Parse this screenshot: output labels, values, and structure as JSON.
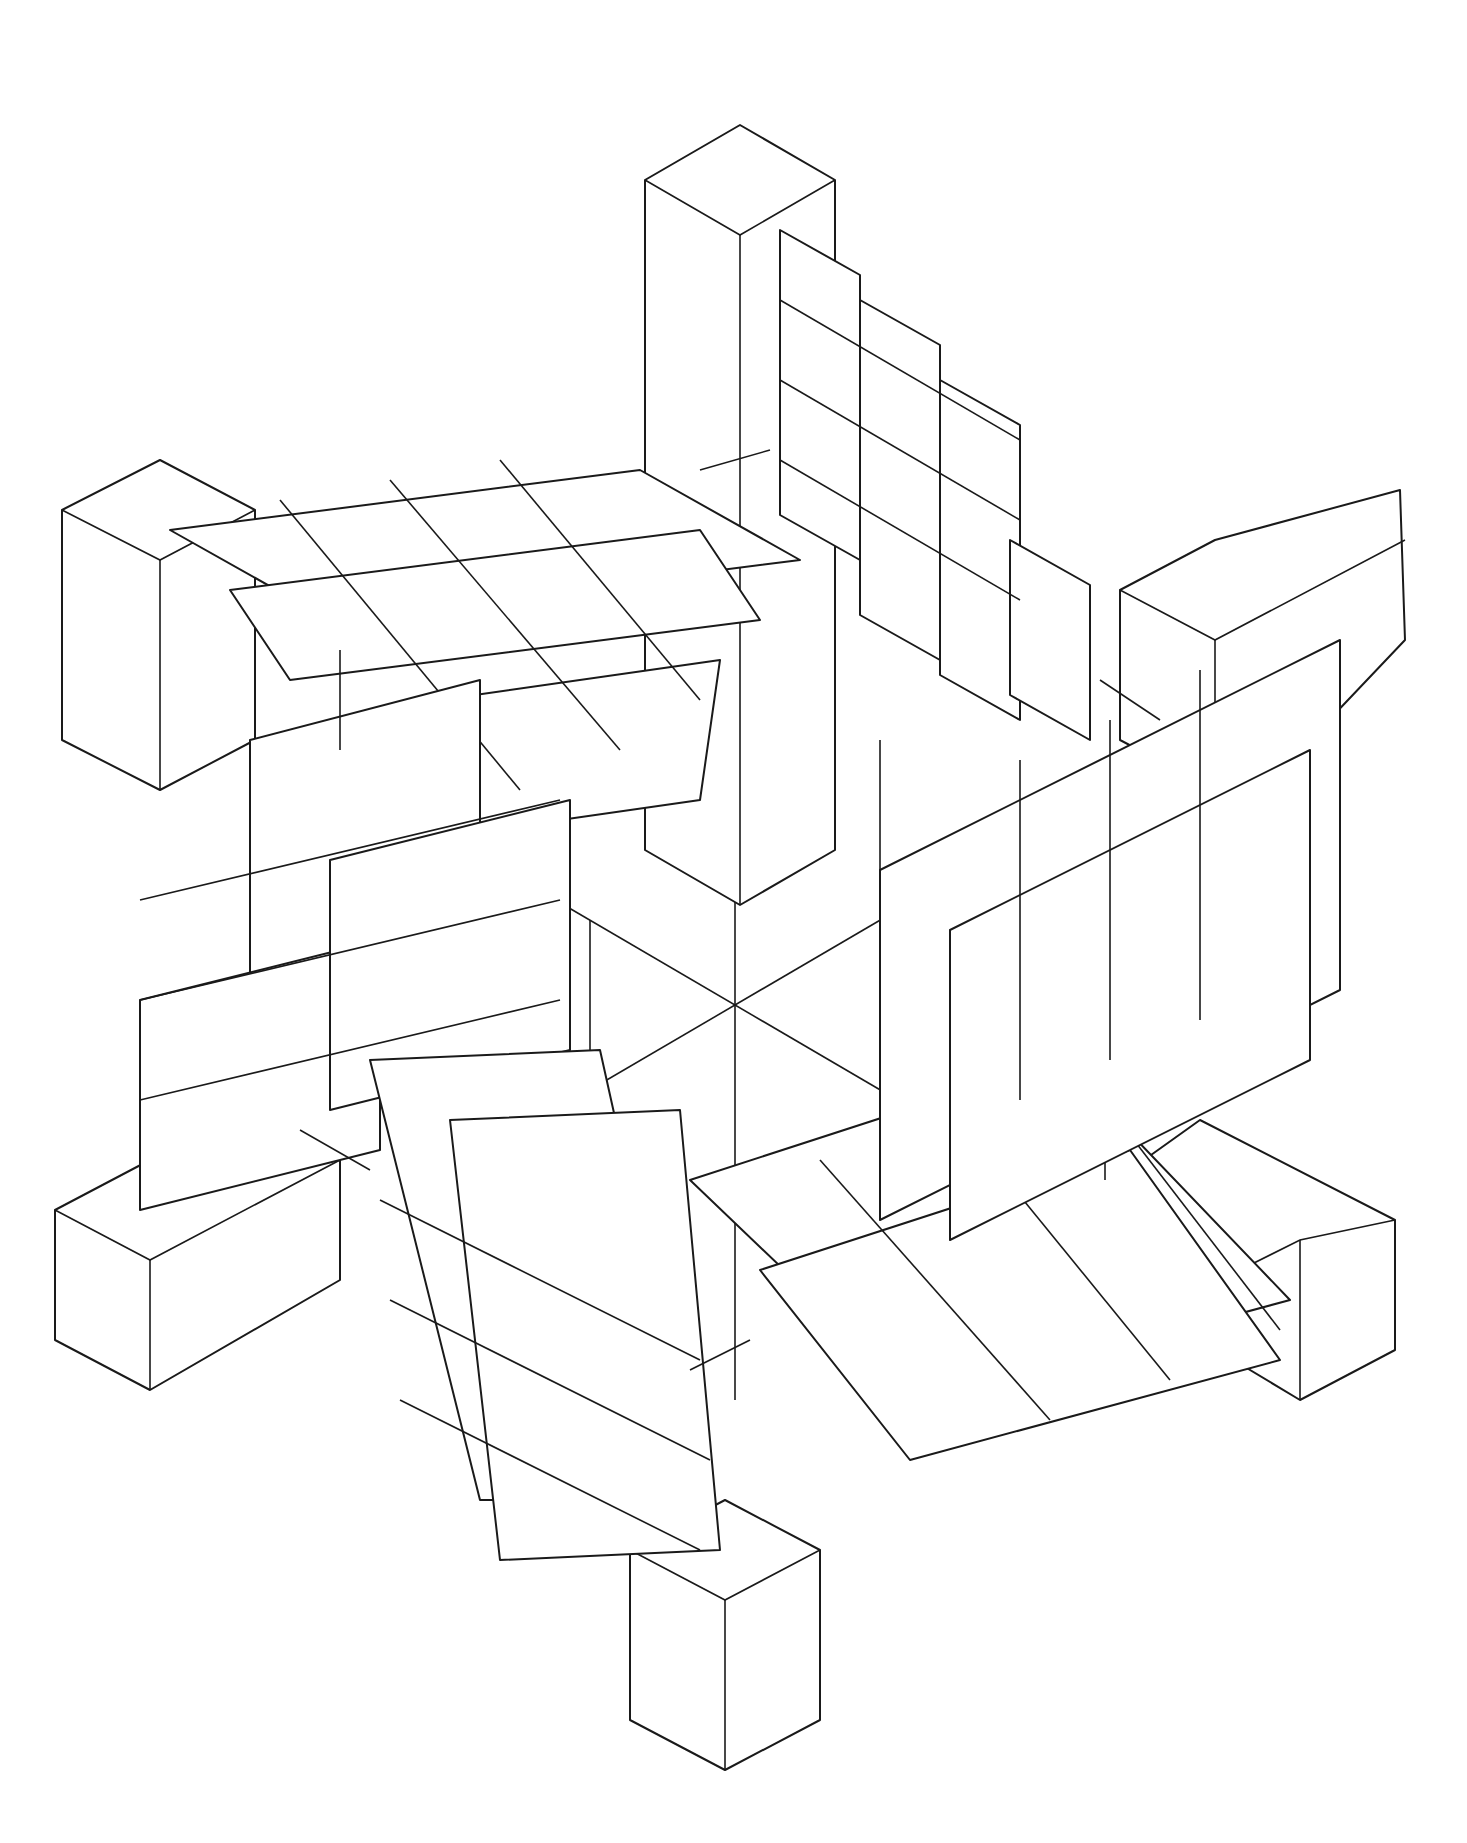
{
  "drawing": {
    "kind": "isometric-line-drawing",
    "stroke_color": "#1a1a1a",
    "background_color": "#ffffff",
    "center": [
      735,
      1000
    ],
    "arms": [
      {
        "name": "top",
        "block": [
          [
            645,
            180
          ],
          [
            740,
            125
          ],
          [
            835,
            180
          ],
          [
            835,
            850
          ],
          [
            740,
            905
          ],
          [
            645,
            850
          ]
        ]
      },
      {
        "name": "upper-left",
        "block": [
          [
            62,
            510
          ],
          [
            160,
            460
          ],
          [
            255,
            510
          ],
          [
            255,
            740
          ],
          [
            160,
            790
          ],
          [
            62,
            740
          ]
        ]
      },
      {
        "name": "upper-right",
        "block": [
          [
            1120,
            590
          ],
          [
            1215,
            540
          ],
          [
            1310,
            590
          ],
          [
            1310,
            740
          ],
          [
            1215,
            790
          ],
          [
            1120,
            740
          ]
        ]
      },
      {
        "name": "lower-left",
        "block": [
          [
            55,
            1210
          ],
          [
            150,
            1160
          ],
          [
            245,
            1210
          ],
          [
            245,
            1340
          ],
          [
            150,
            1390
          ],
          [
            55,
            1340
          ]
        ]
      },
      {
        "name": "lower-right",
        "block": [
          [
            1200,
            1160
          ],
          [
            1300,
            1110
          ],
          [
            1395,
            1160
          ],
          [
            1395,
            1290
          ],
          [
            1300,
            1340
          ],
          [
            1200,
            1290
          ]
        ]
      },
      {
        "name": "bottom",
        "block": [
          [
            630,
            1720
          ],
          [
            725,
            1665
          ],
          [
            820,
            1720
          ],
          [
            820,
            1815
          ],
          [
            725,
            1870
          ],
          [
            630,
            1815
          ]
        ]
      }
    ]
  }
}
